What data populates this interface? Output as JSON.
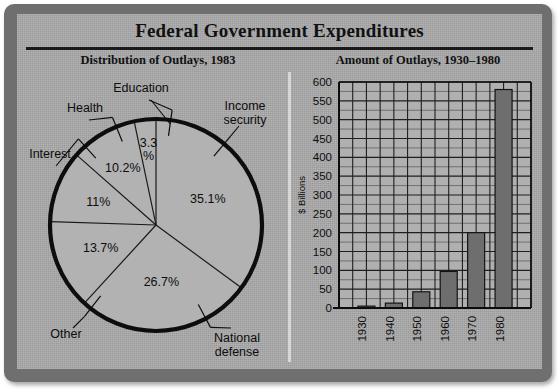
{
  "title": "Federal Government Expenditures",
  "panels": {
    "left_subtitle": "Distribution of Outlays, 1983",
    "right_subtitle": "Amount of Outlays, 1930–1980"
  },
  "colors": {
    "frame": "#6f6f6f",
    "panel": "#a9a9a9",
    "ink": "#111111",
    "bar_fill": "#6e6e6e",
    "pie_fill": "#b2b2b2",
    "divider": "#d6d6d6"
  },
  "chart_data": [
    {
      "type": "pie",
      "title": "Distribution of Outlays, 1983",
      "unit": "percent",
      "start_angle_deg": 0,
      "direction": "clockwise",
      "labels": [
        "Income security",
        "National defense",
        "Other",
        "Interest",
        "Health",
        "Education"
      ],
      "values": [
        35.1,
        26.7,
        13.7,
        11,
        10.2,
        3.3
      ],
      "value_labels": [
        "35.1%",
        "26.7%",
        "13.7%",
        "11%",
        "10.2%",
        "3.3\n%"
      ],
      "slices": [
        {
          "label": "Income security",
          "value": 35.1,
          "value_label": "35.1%"
        },
        {
          "label": "National defense",
          "value": 26.7,
          "value_label": "26.7%"
        },
        {
          "label": "Other",
          "value": 13.7,
          "value_label": "13.7%"
        },
        {
          "label": "Interest",
          "value": 11.0,
          "value_label": "11%"
        },
        {
          "label": "Health",
          "value": 10.2,
          "value_label": "10.2%"
        },
        {
          "label": "Education",
          "value": 3.3,
          "value_label": "3.3 %"
        }
      ],
      "callouts": [
        {
          "label": "Education",
          "line1": "Education",
          "line2": ""
        },
        {
          "label": "Health",
          "line1": "Health",
          "line2": ""
        },
        {
          "label": "Interest",
          "line1": "Interest",
          "line2": ""
        },
        {
          "label": "Other",
          "line1": "Other",
          "line2": ""
        },
        {
          "label": "Income security",
          "line1": "Income",
          "line2": "security"
        },
        {
          "label": "National defense",
          "line1": "National",
          "line2": "defense"
        }
      ],
      "legend": "none",
      "grid": false
    },
    {
      "type": "bar",
      "title": "Amount of Outlays, 1930–1980",
      "categories": [
        "1930",
        "1940",
        "1950",
        "1960",
        "1970",
        "1980"
      ],
      "values": [
        5,
        13,
        43,
        97,
        200,
        580
      ],
      "xlabel": "",
      "ylabel": "$ Billions",
      "ylim": [
        0,
        600
      ],
      "ytick_step": 50,
      "yticks": [
        0,
        50,
        100,
        150,
        200,
        250,
        300,
        350,
        400,
        450,
        500,
        550,
        600
      ],
      "ytick_labels": [
        "0",
        "50",
        "100",
        "150",
        "200",
        "250",
        "300",
        "350",
        "400",
        "450",
        "500",
        "550",
        "600"
      ],
      "minor_ytick_step": 25,
      "grid": true,
      "legend": "none"
    }
  ]
}
